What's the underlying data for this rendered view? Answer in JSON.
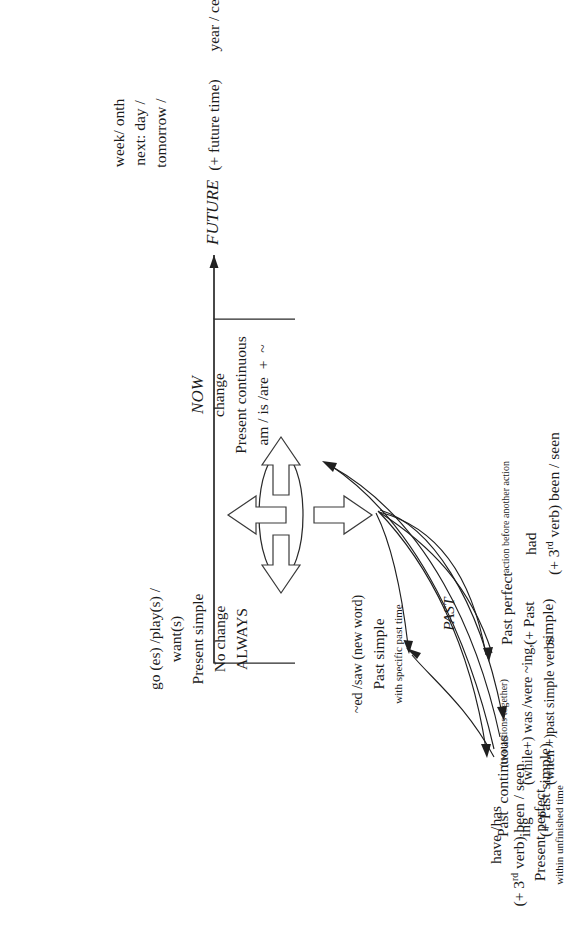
{
  "diagram": {
    "orientation": "rotated-90-ccw",
    "background_color": "#ffffff",
    "ink_color": "#1c1c1c"
  },
  "future": {
    "axis_label": "FUTURE",
    "axis_note": "(+ future time)",
    "time_words": [
      "tomorrow /",
      "next: day /",
      "week/ onth"
    ],
    "time_words_tail": "year / century"
  },
  "present_simple": {
    "forms": "go (es) /play(s) /",
    "forms2": "want(s)",
    "tense": "Present simple",
    "note1": "No change",
    "note2": "ALWAYS"
  },
  "now": {
    "axis_label": "NOW",
    "note": "change",
    "tense": "Present continuous",
    "form": "am / is /are  +  ~"
  },
  "past_simple": {
    "forms": "~ed /saw (new word)",
    "tense": "Past simple",
    "note": "with specific past time"
  },
  "present_perfect": {
    "forms": "have /has",
    "forms2": "(+ 3",
    "forms2_sup": "rd",
    "forms2_tail": " verb) been / seen",
    "tense": "Present perfect",
    "note": "within unfinished time"
  },
  "past_axis": {
    "label": "PAST"
  },
  "past_perfect": {
    "tense": "Past perfect",
    "line2": "(+ Past",
    "line3": "simple)",
    "note": "action before another action",
    "form1": "had",
    "form2": "(+ 3",
    "form2_sup": "rd",
    "form2_tail": " verb) been / seen"
  },
  "past_continuous": {
    "tense": "Past  continuous",
    "line2": "ing",
    "line3": "(+ Past simple)",
    "note": "(two actions together)",
    "form1": "(while+) was /were ~ing,",
    "form2": "(when +)past simple verbs"
  }
}
